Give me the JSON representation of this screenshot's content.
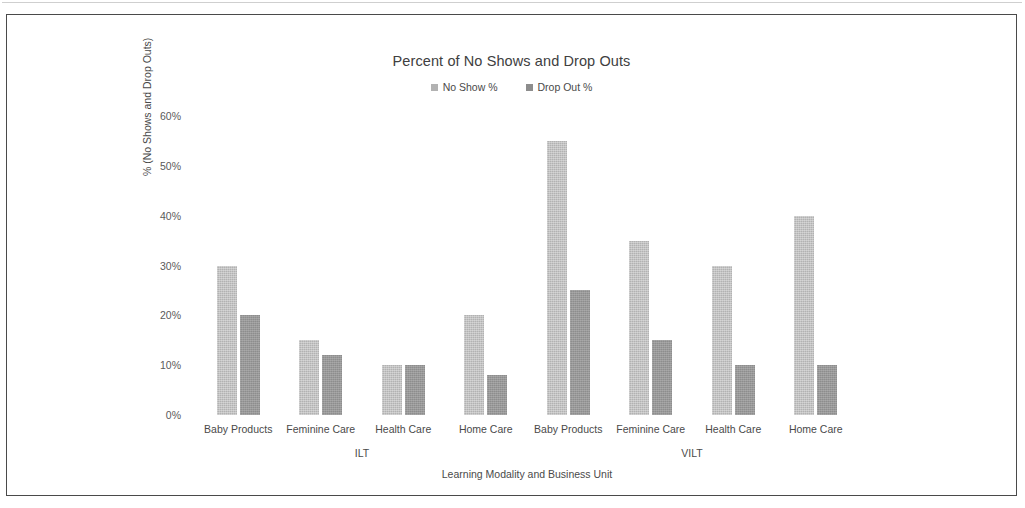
{
  "chart_data": {
    "type": "bar",
    "title": "Percent of No Shows and Drop Outs",
    "xlabel": "Learning Modality and Business Unit",
    "ylabel": "% (No Shows and Drop Outs)",
    "ylim": [
      0,
      60
    ],
    "ytick_labels": [
      "60%",
      "50%",
      "40%",
      "30%",
      "20%",
      "10%",
      "0%"
    ],
    "ytick_values": [
      60,
      50,
      40,
      30,
      20,
      10,
      0
    ],
    "grid": false,
    "legend_position": "top-center",
    "categories": [
      "Baby Products",
      "Feminine Care",
      "Health Care",
      "Home Care",
      "Baby Products",
      "Feminine Care",
      "Health Care",
      "Home Care"
    ],
    "supergroups": [
      {
        "label": "ILT",
        "span": 4
      },
      {
        "label": "VILT",
        "span": 4
      }
    ],
    "series": [
      {
        "name": "No Show %",
        "color": "#b2b2b2",
        "values": [
          30,
          15,
          10,
          20,
          55,
          35,
          30,
          40
        ]
      },
      {
        "name": "Drop Out %",
        "color": "#8d8d8d",
        "values": [
          20,
          12,
          10,
          8,
          25,
          15,
          10,
          10
        ]
      }
    ]
  }
}
